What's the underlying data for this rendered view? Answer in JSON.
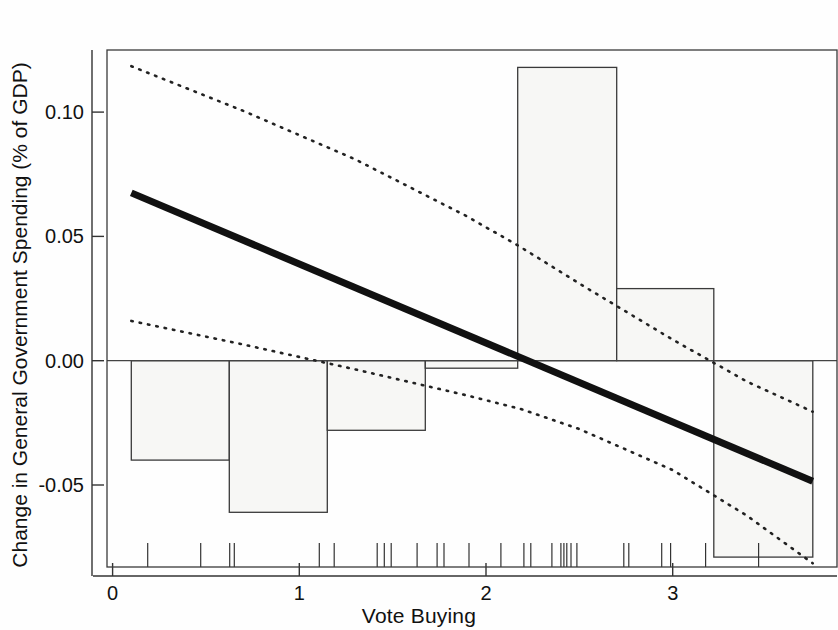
{
  "figure": {
    "background_color": "#fefefe",
    "width": 838,
    "height": 630
  },
  "chart_data": {
    "type": "bar",
    "subtype": "histogram-with-regression-overlay",
    "title": "",
    "xlabel": "Vote Buying",
    "ylabel": "Change in General Government Spending (% of GDP)",
    "xlim": [
      -0.03,
      3.88
    ],
    "ylim": [
      -0.083,
      0.125
    ],
    "xticks": [
      0,
      1,
      2,
      3
    ],
    "xtick_labels": [
      "0",
      "1",
      "2",
      "3"
    ],
    "yticks": [
      -0.05,
      0.0,
      0.05,
      0.1
    ],
    "ytick_labels": [
      "-0.05",
      "0.00",
      "0.05",
      "0.10"
    ],
    "grid": false,
    "legend": null,
    "zero_line": 0.0,
    "histogram": {
      "bin_edges": [
        0.1,
        0.625,
        1.15,
        1.52,
        1.675,
        2.17,
        2.7,
        3.22,
        3.75
      ],
      "bars": [
        {
          "x_left": 0.1,
          "x_right": 0.625,
          "value": -0.04
        },
        {
          "x_left": 0.625,
          "x_right": 1.15,
          "value": -0.061
        },
        {
          "x_left": 1.15,
          "x_right": 1.675,
          "value": -0.028
        },
        {
          "x_left": 1.675,
          "x_right": 2.17,
          "value": -0.003
        },
        {
          "x_left": 2.17,
          "x_right": 2.7,
          "value": 0.118
        },
        {
          "x_left": 2.7,
          "x_right": 3.22,
          "value": 0.029
        },
        {
          "x_left": 3.22,
          "x_right": 3.75,
          "value": -0.079
        }
      ],
      "fill_color": "#f7f7f5",
      "edge_color": "#3a3a3a"
    },
    "fit_line": {
      "name": "regression-fit",
      "style": "solid",
      "color": "#111111",
      "width_px": 7,
      "points": [
        {
          "x": 0.1,
          "y": 0.0675
        },
        {
          "x": 3.75,
          "y": -0.0485
        }
      ],
      "x_intercept": 2.19
    },
    "confidence_bands": [
      {
        "name": "upper-confidence-band",
        "style": "dotted",
        "color": "#222222",
        "points": [
          {
            "x": 0.1,
            "y": 0.1185
          },
          {
            "x": 0.7,
            "y": 0.1005
          },
          {
            "x": 1.3,
            "y": 0.081
          },
          {
            "x": 1.9,
            "y": 0.058
          },
          {
            "x": 2.19,
            "y": 0.0455
          },
          {
            "x": 2.5,
            "y": 0.031
          },
          {
            "x": 3.0,
            "y": 0.0085
          },
          {
            "x": 3.4,
            "y": -0.0085
          },
          {
            "x": 3.75,
            "y": -0.0205
          }
        ]
      },
      {
        "name": "lower-confidence-band",
        "style": "dotted",
        "color": "#222222",
        "points": [
          {
            "x": 0.1,
            "y": 0.016
          },
          {
            "x": 0.7,
            "y": 0.0065
          },
          {
            "x": 1.3,
            "y": -0.0035
          },
          {
            "x": 1.9,
            "y": -0.014
          },
          {
            "x": 2.19,
            "y": -0.0195
          },
          {
            "x": 2.5,
            "y": -0.0275
          },
          {
            "x": 3.0,
            "y": -0.044
          },
          {
            "x": 3.4,
            "y": -0.0625
          },
          {
            "x": 3.75,
            "y": -0.0815
          }
        ]
      }
    ],
    "rug_marks": {
      "name": "rug-plot",
      "axis": "x",
      "values": [
        0.188,
        0.472,
        0.627,
        0.652,
        1.107,
        1.187,
        1.417,
        1.455,
        1.492,
        1.631,
        1.738,
        1.775,
        1.909,
        2.08,
        2.203,
        2.24,
        2.353,
        2.401,
        2.417,
        2.433,
        2.455,
        2.487,
        2.738,
        2.765,
        2.941,
        2.989,
        3.176,
        3.46
      ]
    }
  },
  "axis_labels": {
    "x_title": "Vote Buying",
    "y_title": "Change in General Government Spending (% of GDP)"
  }
}
